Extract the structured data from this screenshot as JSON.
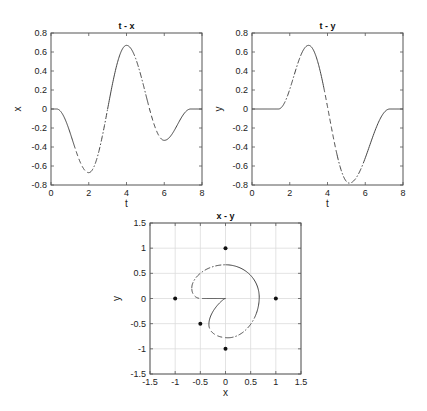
{
  "chart_data": [
    {
      "type": "line",
      "title": "t - x",
      "xlabel": "t",
      "ylabel": "x",
      "xlim": [
        0,
        8
      ],
      "ylim": [
        -0.8,
        0.8
      ],
      "xticks": [
        "0",
        "2",
        "4",
        "6",
        "8"
      ],
      "yticks": [
        "-0.8",
        "-0.6",
        "-0.4",
        "-0.2",
        "0",
        "0.2",
        "0.4",
        "0.6",
        "0.8"
      ],
      "grid": false,
      "keypoints": {
        "t": [
          0,
          0.3,
          2,
          4,
          6,
          7.4,
          8
        ],
        "v": [
          0,
          0,
          -0.67,
          0.67,
          -0.33,
          0,
          0
        ]
      },
      "segments": [
        {
          "from": 0,
          "to": 1.2,
          "style": "solid"
        },
        {
          "from": 1.2,
          "to": 2.0,
          "style": "dashed"
        },
        {
          "from": 2.0,
          "to": 3.0,
          "style": "dashdot"
        },
        {
          "from": 3.0,
          "to": 4.3,
          "style": "solid"
        },
        {
          "from": 4.3,
          "to": 5.1,
          "style": "dashdot"
        },
        {
          "from": 5.1,
          "to": 6.0,
          "style": "dashed"
        },
        {
          "from": 6.0,
          "to": 8.0,
          "style": "solid"
        }
      ]
    },
    {
      "type": "line",
      "title": "t - y",
      "xlabel": "t",
      "ylabel": "y",
      "xlim": [
        0,
        8
      ],
      "ylim": [
        -0.8,
        0.8
      ],
      "xticks": [
        "0",
        "2",
        "4",
        "6",
        "8"
      ],
      "yticks": [
        "-0.8",
        "-0.6",
        "-0.4",
        "-0.2",
        "0",
        "0.2",
        "0.4",
        "0.6",
        "0.8"
      ],
      "grid": false,
      "keypoints": {
        "t": [
          0,
          1.4,
          3,
          5.15,
          7.3,
          8
        ],
        "v": [
          0,
          0,
          0.67,
          -0.78,
          0,
          0
        ]
      },
      "segments": [
        {
          "from": 0,
          "to": 1.6,
          "style": "solid"
        },
        {
          "from": 1.6,
          "to": 2.6,
          "style": "dashdot"
        },
        {
          "from": 2.6,
          "to": 3.8,
          "style": "solid"
        },
        {
          "from": 3.8,
          "to": 4.5,
          "style": "dashed"
        },
        {
          "from": 4.5,
          "to": 5.9,
          "style": "dashdot"
        },
        {
          "from": 5.9,
          "to": 8.0,
          "style": "solid"
        }
      ]
    },
    {
      "type": "line",
      "title": "x - y",
      "xlabel": "x",
      "ylabel": "y",
      "xlim": [
        -1.5,
        1.5
      ],
      "ylim": [
        -1.5,
        1.5
      ],
      "xticks": [
        "-1.5",
        "-1",
        "-0.5",
        "0",
        "0.5",
        "1",
        "1.5"
      ],
      "yticks": [
        "-1.5",
        "-1",
        "-0.5",
        "0",
        "0.5",
        "1",
        "1.5"
      ],
      "grid": true,
      "curve": "parametric (x(t), y(t)) from the two plots above",
      "markers": [
        [
          0,
          1
        ],
        [
          -1,
          0
        ],
        [
          1,
          0
        ],
        [
          0,
          -1
        ],
        [
          -0.5,
          -0.5
        ]
      ]
    }
  ]
}
